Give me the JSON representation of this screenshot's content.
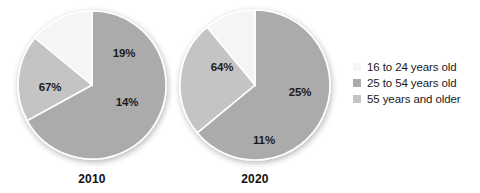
{
  "figure": {
    "background": "#ffffff"
  },
  "chart_data": {
    "type": "pie",
    "title": "",
    "categories": [
      "16 to 24 years old",
      "25 to 54 years old",
      "55 years and older"
    ],
    "colors": [
      "#f5f5f5",
      "#ababab",
      "#c4c4c4"
    ],
    "charts": [
      {
        "label": "2010",
        "center": [
          92,
          85
        ],
        "radius": 74,
        "slices": [
          {
            "name": "55 years and older",
            "value": 67,
            "label": "67%",
            "color": "#ababab",
            "label_pos": [
              50,
              87
            ]
          },
          {
            "name": "25 to 54 years old",
            "value": 19,
            "label": "19%",
            "color": "#c4c4c4",
            "label_pos": [
              124,
              53
            ]
          },
          {
            "name": "16 to 24 years old",
            "value": 14,
            "label": "14%",
            "color": "#f5f5f5",
            "label_pos": [
              127,
              102
            ]
          }
        ]
      },
      {
        "label": "2020",
        "center": [
          255,
          85
        ],
        "radius": 75,
        "slices": [
          {
            "name": "55 years and older",
            "value": 64,
            "label": "64%",
            "color": "#ababab",
            "label_pos": [
              222,
              67
            ]
          },
          {
            "name": "25 to 54 years old",
            "value": 25,
            "label": "25%",
            "color": "#c4c4c4",
            "label_pos": [
              300,
              92
            ]
          },
          {
            "name": "16 to 24 years old",
            "value": 11,
            "label": "11%",
            "color": "#f5f5f5",
            "label_pos": [
              264,
              140
            ]
          }
        ]
      }
    ],
    "legend": {
      "position": "right",
      "entries": [
        {
          "label": "16 to 24 years old",
          "color": "#f5f5f5"
        },
        {
          "label": "25 to 54 years old",
          "color": "#ababab"
        },
        {
          "label": "55 years and older",
          "color": "#c4c4c4"
        }
      ]
    },
    "xlabel": "",
    "ylabel": ""
  },
  "year_labels": [
    {
      "text": "2010",
      "x": 92,
      "y": 172
    },
    {
      "text": "2020",
      "x": 255,
      "y": 172
    }
  ]
}
